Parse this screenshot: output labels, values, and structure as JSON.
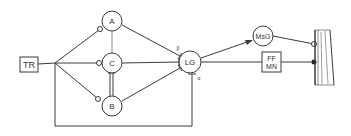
{
  "diagram": {
    "nodes": {
      "tr": {
        "label": "TR",
        "shape": "box"
      },
      "a": {
        "label": "A",
        "shape": "circle"
      },
      "c": {
        "label": "C",
        "shape": "circle"
      },
      "b": {
        "label": "B",
        "shape": "circle"
      },
      "lg": {
        "label": "LG",
        "shape": "circle"
      },
      "msg": {
        "label": "MsG",
        "shape": "circle"
      },
      "ffmn": {
        "label_line1": "FF",
        "label_line2": "MN",
        "shape": "box"
      },
      "muscle": {
        "label": "",
        "shape": "hatched-bar"
      }
    },
    "annotations": {
      "lg_top_mark": "β",
      "lg_bottom_mark": "α"
    },
    "edges": [
      {
        "from": "TR",
        "to": "junction",
        "terminal": "none"
      },
      {
        "from": "junction",
        "to": "A",
        "terminal": "open-circle"
      },
      {
        "from": "junction",
        "to": "C",
        "terminal": "open-circle"
      },
      {
        "from": "junction",
        "to": "B",
        "terminal": "open-circle"
      },
      {
        "from": "A",
        "to": "C",
        "terminal": "none"
      },
      {
        "from": "C",
        "to": "B",
        "terminal": "bar"
      },
      {
        "from": "A",
        "to": "LG",
        "terminal": "bar"
      },
      {
        "from": "C",
        "to": "LG",
        "terminal": "bar"
      },
      {
        "from": "B",
        "to": "LG",
        "terminal": "bar"
      },
      {
        "from": "junction",
        "to": "LG",
        "terminal": "bar",
        "route": "bottom-loop"
      },
      {
        "from": "LG",
        "to": "MsG",
        "terminal": "arrow"
      },
      {
        "from": "LG",
        "to": "FF MN",
        "terminal": "none"
      },
      {
        "from": "MsG",
        "to": "muscle",
        "terminal": "open-circle"
      },
      {
        "from": "FF MN",
        "to": "muscle",
        "terminal": "filled-circle"
      }
    ],
    "colors": {
      "stroke": "#3a3a3a",
      "background": "#ffffff"
    }
  }
}
